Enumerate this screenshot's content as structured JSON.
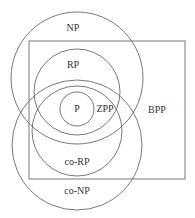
{
  "diagram": {
    "type": "complexity-class-venn",
    "labels": {
      "np": "NP",
      "rp": "RP",
      "p": "P",
      "zpp": "ZPP",
      "bpp": "BPP",
      "co_rp": "co-RP",
      "co_np": "co-NP"
    },
    "colors": {
      "stroke": "#6a6a6a",
      "text": "#333333",
      "background": "#ffffff"
    },
    "shapes": {
      "np_circle": {
        "cx": 77,
        "cy": 78,
        "r": 66
      },
      "co_np_circle": {
        "cx": 77,
        "cy": 145,
        "r": 65
      },
      "rp_circle": {
        "cx": 77,
        "cy": 92,
        "r": 43
      },
      "co_rp_circle": {
        "cx": 77,
        "cy": 131,
        "r": 45
      },
      "p_circle": {
        "cx": 77,
        "cy": 109,
        "r": 17
      },
      "bpp_rect": {
        "x": 29,
        "y": 41,
        "width": 156,
        "height": 138
      }
    }
  }
}
